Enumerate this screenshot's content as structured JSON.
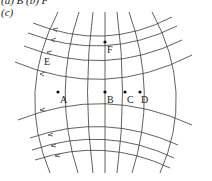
{
  "captions": {
    "top": "(a) B (b) F",
    "part": "(c)"
  },
  "diagram": {
    "line_color": "#333333",
    "point_color": "#111111",
    "points": [
      {
        "label": "A",
        "x": 58,
        "y": 92
      },
      {
        "label": "B",
        "x": 105,
        "y": 92
      },
      {
        "label": "C",
        "x": 125,
        "y": 92
      },
      {
        "label": "D",
        "x": 140,
        "y": 92
      },
      {
        "label": "F",
        "x": 105,
        "y": 42
      }
    ],
    "labels": {
      "A": "A",
      "B": "B",
      "C": "C",
      "D": "D",
      "E": "E",
      "F": "F"
    }
  }
}
